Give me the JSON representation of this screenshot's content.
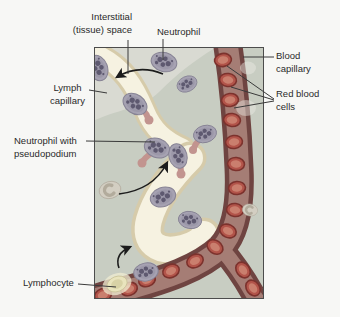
{
  "figure": {
    "labels": {
      "interstitial": {
        "line1": "Interstitial",
        "line2": "(tissue) space"
      },
      "neutrophil": {
        "text": "Neutrophil"
      },
      "blood_capillary": {
        "line1": "Blood",
        "line2": "capillary"
      },
      "red_blood_cells": {
        "line1": "Red blood",
        "line2": "cells"
      },
      "lymph_capillary": {
        "line1": "Lymph",
        "line2": "capillary"
      },
      "neutrophil_pseudopodium": {
        "line1": "Neutrophil with",
        "line2": "pseudopodium"
      },
      "lymphocyte": {
        "text": "Lymphocyte"
      }
    },
    "colors": {
      "tissue": "#c8cdc2",
      "interstitial_light": "#d9dad2",
      "lymph_fill": "#f6f2e1",
      "lymph_edge": "#d6cbaa",
      "capillary_wall": "#6f4441",
      "capillary_lumen": "#a57d75",
      "rbc_fill": "#b2544a",
      "rbc_rim": "#7c322d",
      "rbc_core": "#ca7f6e",
      "neutrophil_body": "#a6a2b2",
      "neutrophil_rim": "#868294",
      "neutrophil_nucleus": "#5e5970",
      "pseudopod": "#c2948f",
      "lymphocyte_fill": "#e9e4bd",
      "lymphocyte_halo": "#f0ecd2",
      "pale_cell": "#d3cec2",
      "pale_cell_nucleus": "#b2ab9c",
      "arrow": "#1c1c1c",
      "label_text": "#2a2a2a",
      "leader": "#3a3a3a",
      "panel_border": "#4c4c4c"
    }
  }
}
